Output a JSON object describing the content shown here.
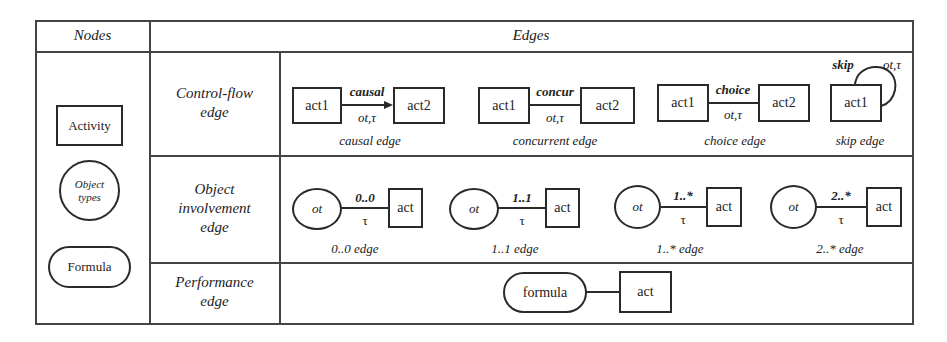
{
  "table": {
    "header": {
      "nodes": "Nodes",
      "edges": "Edges"
    },
    "nodes": {
      "activity": "Activity",
      "object_types_line1": "Object",
      "object_types_line2": "types",
      "formula": "Formula"
    },
    "rows": [
      {
        "label_line1": "Control-flow",
        "label_line2": "edge",
        "edges": [
          {
            "from": "act1",
            "to": "act2",
            "label": "causal",
            "annotation": "ot,τ",
            "caption": "causal edge",
            "arrow": true
          },
          {
            "from": "act1",
            "to": "act2",
            "label": "concur",
            "annotation": "ot,τ",
            "caption": "concurrent edge",
            "arrow": false
          },
          {
            "from": "act1",
            "to": "act2",
            "label": "choice",
            "annotation": "ot,τ",
            "caption": "choice edge",
            "arrow": false
          },
          {
            "from": "act1",
            "label": "skip",
            "annotation": "ot,τ",
            "caption": "skip edge",
            "loop": true
          }
        ]
      },
      {
        "label_line1": "Object",
        "label_line2": "involvement",
        "label_line3": "edge",
        "edges": [
          {
            "from": "ot",
            "to": "act",
            "label": "0..0",
            "annotation": "τ",
            "caption": "0..0 edge"
          },
          {
            "from": "ot",
            "to": "act",
            "label": "1..1",
            "annotation": "τ",
            "caption": "1..1 edge"
          },
          {
            "from": "ot",
            "to": "act",
            "label": "1..*",
            "annotation": "τ",
            "caption": "1..* edge"
          },
          {
            "from": "ot",
            "to": "act",
            "label": "2..*",
            "annotation": "τ",
            "caption": "2..* edge"
          }
        ]
      },
      {
        "label_line1": "Performance",
        "label_line2": "edge",
        "edges": [
          {
            "from": "formula",
            "to": "act"
          }
        ]
      }
    ]
  },
  "colors": {
    "stroke": "#2a2a2a",
    "grid": "#444444",
    "background": "#ffffff"
  }
}
